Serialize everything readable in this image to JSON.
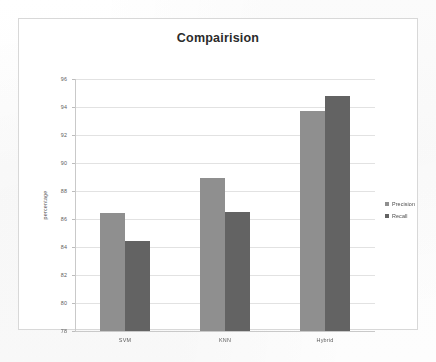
{
  "page": {
    "background_color": "#fdfdfd"
  },
  "chart": {
    "frame_border_color": "#d8d8d8",
    "plot_background": "#ffffff",
    "gridline_color": "#e2e2e2"
  },
  "chart_data": {
    "type": "bar",
    "title": "Compairision",
    "xlabel": "",
    "ylabel": "percentage",
    "categories": [
      "SVM",
      "KNN",
      "Hybrid"
    ],
    "series": [
      {
        "name": "Precision",
        "color": "#8f8f8f",
        "values": [
          86.4,
          88.9,
          93.7
        ]
      },
      {
        "name": "Recall",
        "color": "#636363",
        "values": [
          84.4,
          86.5,
          94.8
        ]
      }
    ],
    "ylim": [
      78,
      96
    ],
    "ytick_values": [
      96,
      94,
      92,
      90,
      88,
      86,
      84,
      82,
      80,
      78
    ],
    "ytick_labels": [
      "96",
      "94",
      "92",
      "90",
      "88",
      "86",
      "84",
      "82",
      "80",
      "78"
    ],
    "grid": true,
    "grid_axis": "y",
    "legend": {
      "position": "right",
      "entries": [
        "Precision",
        "Recall"
      ]
    }
  }
}
